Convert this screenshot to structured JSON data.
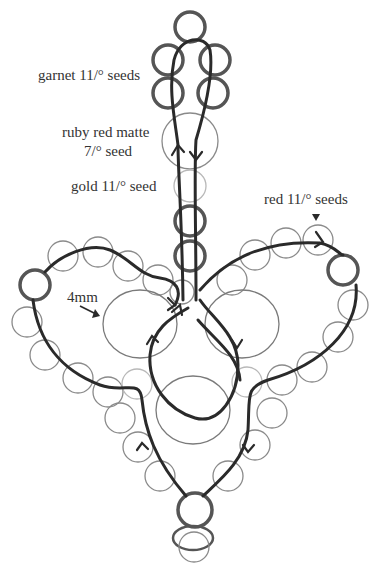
{
  "diagram": {
    "type": "beading pattern",
    "labels": {
      "garnet": "garnet 11/° seeds",
      "ruby_line1": "ruby red matte",
      "ruby_line2": "7/° seed",
      "gold": "gold 11/° seed",
      "red": "red 11/° seeds",
      "size_4mm": "4mm"
    },
    "colors": {
      "thread": "#2a2a2a",
      "bold_bead": "#555555",
      "thin_bead": "#8a8a8a",
      "faint_bead": "#b8b8b8",
      "text": "#333333"
    }
  }
}
